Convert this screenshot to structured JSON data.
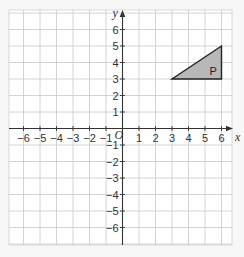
{
  "figure": {
    "x_axis_label": "x",
    "y_axis_label": "y",
    "origin_label": "O",
    "x_range": [
      -7,
      6.7
    ],
    "y_range": [
      -7,
      7
    ],
    "x_ticks": [
      -6,
      -5,
      -4,
      -3,
      -2,
      -1,
      1,
      2,
      3,
      4,
      5,
      6
    ],
    "y_ticks": [
      6,
      5,
      4,
      3,
      2,
      1,
      -1,
      -2,
      -3,
      -4,
      -5,
      -6
    ],
    "grid": true,
    "shape": {
      "label": "P",
      "type": "triangle",
      "vertices": [
        [
          3,
          3
        ],
        [
          6,
          3
        ],
        [
          6,
          5
        ]
      ],
      "fill": "#b8b8b8",
      "stroke": "#222222"
    }
  },
  "chart_data": {
    "type": "scatter",
    "title": "",
    "xlabel": "x",
    "ylabel": "y",
    "xlim": [
      -7,
      6.7
    ],
    "ylim": [
      -7,
      7
    ],
    "grid": true,
    "series": [
      {
        "name": "P",
        "shape": "triangle",
        "x": [
          3,
          6,
          6
        ],
        "y": [
          3,
          3,
          5
        ]
      }
    ]
  }
}
